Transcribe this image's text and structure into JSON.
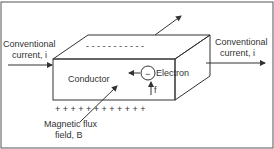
{
  "diagram": {
    "labels": {
      "current_in_line1": "Conventional",
      "current_in_line2": "current, i",
      "current_out_line1": "Conventional",
      "current_out_line2": "current, i",
      "conductor": "Conductor",
      "electron": "Electron",
      "electron_charge": "−",
      "force_label": "f",
      "flux_line1": "Magnetic flux",
      "flux_line2": "field, B",
      "top_charge": "- - - - - - - - - - -",
      "bottom_charge": "+ + + + + + + + + + + +"
    },
    "colors": {
      "stroke": "#333333",
      "background": "#ffffff",
      "frame": "#555555"
    }
  }
}
